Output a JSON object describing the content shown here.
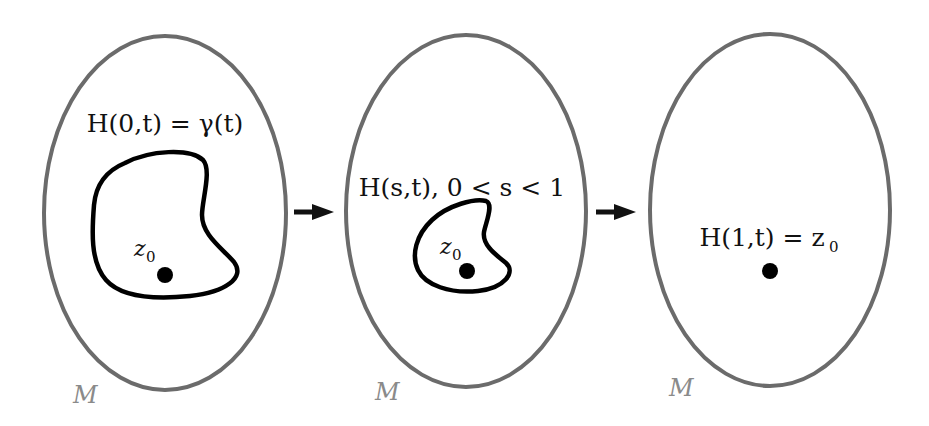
{
  "diagram": {
    "type": "homotopy-contraction",
    "colors": {
      "manifold_outline": "#6b6b6b",
      "loop": "#000000",
      "arrow": "#111111",
      "point": "#000000",
      "manifold_label": "#8a8a8a",
      "text": "#111111"
    },
    "panels": [
      {
        "id": "start",
        "manifold_label": "M",
        "caption": {
          "prefix": "H(0,",
          "var": "t",
          "suffix": ") = ",
          "rhs_fn": "γ",
          "rhs_arg": "(t)"
        },
        "caption_text": "H(0,t) = γ(t)",
        "point_label": "z",
        "point_sub": "0"
      },
      {
        "id": "intermediate",
        "manifold_label": "M",
        "caption_text": "H(s,t),  0 < s < 1",
        "point_label": "z",
        "point_sub": "0"
      },
      {
        "id": "end",
        "manifold_label": "M",
        "caption_text": "H(1,t) = z",
        "caption_sub": "0"
      }
    ],
    "arrows": [
      {
        "from": "start",
        "to": "intermediate"
      },
      {
        "from": "intermediate",
        "to": "end"
      }
    ]
  }
}
